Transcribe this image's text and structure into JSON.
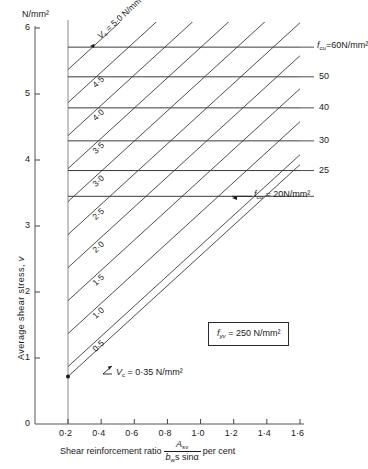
{
  "figure": {
    "yaxis_unit": "N/mm²",
    "yaxis_title_prefix": "Average  shear   stress, ",
    "yaxis_title_symbol": "v",
    "xaxis_title_prefix": "Shear  reinforcement  ratio",
    "xaxis_title_num": "A",
    "xaxis_title_num_sub": "sv",
    "xaxis_title_den": "b",
    "xaxis_title_den_sub": "w",
    "xaxis_title_den_rest": "s sinα",
    "xaxis_title_suffix": "per cent",
    "note_symbol": "f",
    "note_sub": "yv",
    "note_value": " = 250 N/mm²",
    "vc_annotation_symbol": "V",
    "vc_annotation_sub": "c",
    "vc_annotation_value": " = 0·35 N/mm²",
    "vc_top_symbol": "V",
    "vc_top_sub": "c",
    "vc_top_value": " = 5·0 N/mm²",
    "fcu_top_symbol": "f",
    "fcu_top_sub": "cu",
    "fcu_top_value": "=60N/mm²",
    "fcu_bottom_symbol": "f",
    "fcu_bottom_sub": "cu",
    "fcu_bottom_value": " = 20N/mm²"
  },
  "chart_data": {
    "type": "line",
    "title": "",
    "xlabel": "Shear reinforcement ratio  A_sv/(b_w s sinα)  per cent",
    "ylabel": "Average shear stress, v  (N/mm²)",
    "xlim": [
      0.2,
      1.6
    ],
    "ylim": [
      0.0,
      6.0
    ],
    "grid": false,
    "x_ticks": [
      0.2,
      0.4,
      0.6,
      0.8,
      1.0,
      1.2,
      1.4,
      1.6
    ],
    "x_tick_labels": [
      "0·2",
      "0·4",
      "0·6",
      "0·8",
      "1·0",
      "1·2",
      "1·4",
      "1·6"
    ],
    "y_ticks": [
      0,
      1,
      2,
      3,
      4,
      5,
      6
    ],
    "y_tick_labels": [
      "0",
      "1",
      "2",
      "3",
      "4",
      "5",
      "6"
    ],
    "x_axis_origin_label": "0",
    "legend_position": "right-outside",
    "series": [
      {
        "name": "v_c = 0.35 N/mm²",
        "label": "Vᴄ = 0·35 N/mm²",
        "kind": "diagonal",
        "label_text": "",
        "x": [
          0.2,
          1.6
        ],
        "y": [
          0.72,
          3.93
        ]
      },
      {
        "name": "v_c = 0.5",
        "label": "0·5",
        "kind": "diagonal",
        "x": [
          0.2,
          1.6
        ],
        "y": [
          0.87,
          4.08
        ]
      },
      {
        "name": "v_c = 1.0",
        "label": "1·0",
        "kind": "diagonal",
        "x": [
          0.2,
          1.6
        ],
        "y": [
          1.37,
          4.58
        ]
      },
      {
        "name": "v_c = 1.5",
        "label": "1·5",
        "kind": "diagonal",
        "x": [
          0.2,
          1.6
        ],
        "y": [
          1.87,
          5.08
        ]
      },
      {
        "name": "v_c = 2.0",
        "label": "2·0",
        "kind": "diagonal",
        "x": [
          0.2,
          1.6
        ],
        "y": [
          2.37,
          5.58
        ]
      },
      {
        "name": "v_c = 2.5",
        "label": "2·5",
        "kind": "diagonal",
        "x": [
          0.2,
          1.6
        ],
        "y": [
          2.87,
          6.08
        ]
      },
      {
        "name": "v_c = 3.0",
        "label": "3·0",
        "kind": "diagonal",
        "x": [
          0.2,
          1.6
        ],
        "y": [
          3.37,
          6.58
        ]
      },
      {
        "name": "v_c = 3.5",
        "label": "3·5",
        "kind": "diagonal",
        "x": [
          0.2,
          1.6
        ],
        "y": [
          3.87,
          7.08
        ]
      },
      {
        "name": "v_c = 4.0",
        "label": "4·0",
        "kind": "diagonal",
        "x": [
          0.2,
          1.6
        ],
        "y": [
          4.37,
          7.58
        ]
      },
      {
        "name": "v_c = 4.5",
        "label": "4·5",
        "kind": "diagonal",
        "x": [
          0.2,
          1.6
        ],
        "y": [
          4.87,
          8.08
        ]
      },
      {
        "name": "v_c = 5.0",
        "label": "Vᴄ = 5·0 N/mm²",
        "kind": "diagonal",
        "x": [
          0.2,
          1.6
        ],
        "y": [
          5.37,
          8.58
        ]
      }
    ],
    "limit_lines": [
      {
        "name": "f_cu = 60 N/mm²",
        "label": "60",
        "y": 5.71
      },
      {
        "name": "f_cu = 50",
        "label": "50",
        "y": 5.26
      },
      {
        "name": "f_cu = 40",
        "label": "40",
        "y": 4.79
      },
      {
        "name": "f_cu = 30",
        "label": "30",
        "y": 4.29
      },
      {
        "name": "f_cu = 25",
        "label": "25",
        "y": 3.84
      },
      {
        "name": "f_cu = 20",
        "label": "20",
        "y": 3.45
      }
    ],
    "annotations": [
      {
        "name": "fyv-note",
        "text": "f_yv = 250 N/mm²"
      },
      {
        "name": "vc-min-note",
        "text": "V_c = 0·35 N/mm²"
      }
    ]
  }
}
